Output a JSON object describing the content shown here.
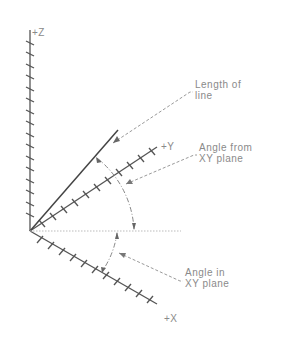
{
  "diagram": {
    "type": "3d-coordinate-axes",
    "axes": {
      "z": {
        "label": "+Z"
      },
      "y": {
        "label": "+Y"
      },
      "x": {
        "label": "+X"
      }
    },
    "annotations": {
      "length_of_line": {
        "line1": "Length of",
        "line2": "line"
      },
      "angle_from_xy": {
        "line1": "Angle from",
        "line2": "XY plane"
      },
      "angle_in_xy": {
        "line1": "Angle in",
        "line2": "XY plane"
      }
    },
    "colors": {
      "axis": "#555555",
      "leader": "#9a9a9a",
      "text": "#8a8a8a",
      "line": "#444444"
    }
  }
}
